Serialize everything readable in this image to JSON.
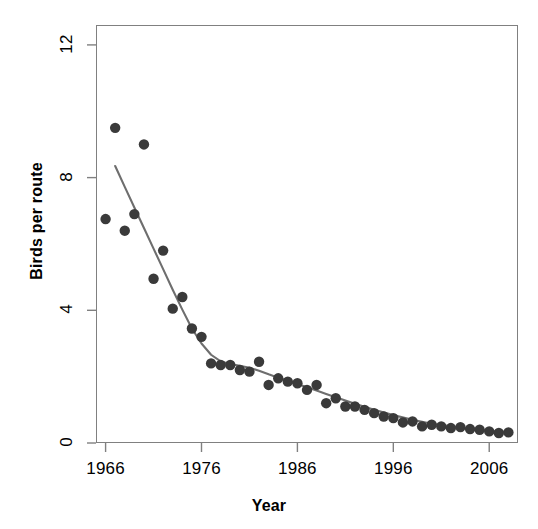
{
  "chart_data": {
    "type": "scatter",
    "title": "",
    "xlabel": "Year",
    "ylabel": "Birds per route",
    "xlim": [
      1965,
      2009
    ],
    "ylim": [
      0,
      12.6
    ],
    "xticks": [
      1966,
      1976,
      1986,
      1996,
      2006
    ],
    "yticks": [
      0,
      4,
      8,
      12
    ],
    "grid": false,
    "legend": null,
    "point_color": "#3a3a3a",
    "line_color": "#6e6e6e",
    "frame_color": "#808080",
    "x": [
      1966,
      1967,
      1968,
      1969,
      1970,
      1971,
      1972,
      1973,
      1974,
      1975,
      1976,
      1977,
      1978,
      1979,
      1980,
      1981,
      1982,
      1983,
      1984,
      1985,
      1986,
      1987,
      1988,
      1989,
      1990,
      1991,
      1992,
      1993,
      1994,
      1995,
      1996,
      1997,
      1998,
      1999,
      2000,
      2001,
      2002,
      2003,
      2004,
      2005,
      2006,
      2007,
      2008
    ],
    "values": [
      6.75,
      9.5,
      6.4,
      6.9,
      9.0,
      4.95,
      5.8,
      4.05,
      4.4,
      3.45,
      3.2,
      2.4,
      2.35,
      2.35,
      2.2,
      2.15,
      2.45,
      1.75,
      1.95,
      1.85,
      1.8,
      1.6,
      1.75,
      1.2,
      1.35,
      1.1,
      1.1,
      1.0,
      0.9,
      0.8,
      0.75,
      0.62,
      0.65,
      0.5,
      0.55,
      0.5,
      0.45,
      0.48,
      0.42,
      0.4,
      0.35,
      0.3,
      0.32
    ],
    "fit_line": {
      "description": "segmented/loess fitted trend",
      "x": [
        1967.0,
        1968.0,
        1969.0,
        1970.0,
        1971.0,
        1972.0,
        1973.0,
        1974.0,
        1975.0,
        1976.0,
        1977.0,
        1978.0,
        1979.0,
        1980.0,
        1981.0,
        1982.0,
        1983.0,
        1984.0,
        1985.0,
        1986.0,
        1987.0,
        1988.0,
        1989.0,
        1990.0,
        1992.0,
        1994.0,
        1996.0,
        1998.0,
        2000.0,
        2002.0,
        2004.0,
        2006.0,
        2008.0
      ],
      "y": [
        8.35,
        7.72,
        7.1,
        6.48,
        5.86,
        5.24,
        4.62,
        4.02,
        3.45,
        3.0,
        2.66,
        2.46,
        2.38,
        2.33,
        2.27,
        2.18,
        2.07,
        1.97,
        1.88,
        1.78,
        1.68,
        1.58,
        1.48,
        1.38,
        1.18,
        1.0,
        0.84,
        0.7,
        0.58,
        0.5,
        0.43,
        0.37,
        0.32
      ]
    }
  },
  "axes": {
    "y_tick_labels": [
      "0",
      "4",
      "8",
      "12"
    ],
    "x_tick_labels": [
      "1966",
      "1976",
      "1986",
      "1996",
      "2006"
    ],
    "y_axis_title": "Birds per route",
    "x_axis_title": "Year"
  }
}
